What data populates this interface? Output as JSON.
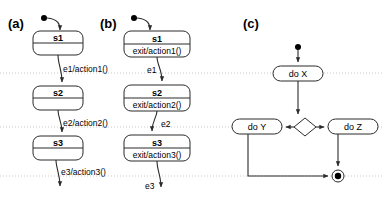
{
  "figure": {
    "type": "uml-state-and-activity-diagrams",
    "width": 383,
    "height": 200,
    "background": "#ffffff",
    "line_color": "#2b2b2b",
    "guide_color": "#c9c9c9"
  },
  "guides": {
    "label": "horizontal dotted alignment guides",
    "y_positions": [
      73,
      127,
      176
    ]
  },
  "panels": [
    {
      "id": "a",
      "label": "(a)",
      "label_x": 8,
      "label_y": 28,
      "kind": "state-machine",
      "description": "states with transition actions on the edges",
      "initial": {
        "name": "initial-state",
        "cx": 44,
        "cy": 18,
        "r": 3
      },
      "states": [
        {
          "name": "s1",
          "activity": "",
          "x": 33,
          "y": 31,
          "w": 50,
          "h": 24,
          "split_y": 43
        },
        {
          "name": "s2",
          "activity": "",
          "x": 33,
          "y": 86,
          "w": 50,
          "h": 24,
          "split_y": 98
        },
        {
          "name": "s3",
          "activity": "",
          "x": 33,
          "y": 136,
          "w": 50,
          "h": 24,
          "split_y": 148
        }
      ],
      "transitions": [
        {
          "label": "e1/action1()",
          "label_x": 62,
          "label_y": 72
        },
        {
          "label": "e2/action2()",
          "label_x": 62,
          "label_y": 126
        },
        {
          "label": "e3/action3()",
          "label_x": 62,
          "label_y": 175
        }
      ]
    },
    {
      "id": "b",
      "label": "(b)",
      "label_x": 100,
      "label_y": 28,
      "kind": "state-machine",
      "description": "states with exit actions inside the state body",
      "initial": {
        "name": "initial-state",
        "cx": 134,
        "cy": 18,
        "r": 3
      },
      "states": [
        {
          "name": "s1",
          "activity": "exit/action1()",
          "x": 124,
          "y": 31,
          "w": 66,
          "h": 26,
          "split_y": 44
        },
        {
          "name": "s2",
          "activity": "exit/action2()",
          "x": 124,
          "y": 85,
          "w": 66,
          "h": 26,
          "split_y": 98
        },
        {
          "name": "s3",
          "activity": "exit/action3()",
          "x": 124,
          "y": 135,
          "w": 66,
          "h": 26,
          "split_y": 148
        }
      ],
      "transitions": [
        {
          "label": "e1",
          "label_x": 148,
          "label_y": 72
        },
        {
          "label": "e2",
          "label_x": 163,
          "label_y": 126
        },
        {
          "label": "e3",
          "label_x": 148,
          "label_y": 186
        }
      ]
    },
    {
      "id": "c",
      "label": "(c)",
      "label_x": 243,
      "label_y": 28,
      "kind": "activity-diagram",
      "description": "initial node, do X, decision, do Y and do Z branches, final node",
      "initial": {
        "name": "initial-node",
        "cx": 298,
        "cy": 47,
        "r": 3
      },
      "final": {
        "name": "final-node",
        "cx": 338,
        "cy": 176,
        "r_outer": 6,
        "r_inner": 3
      },
      "decision": {
        "name": "decision-diamond",
        "cx": 305,
        "cy": 127,
        "rx": 11,
        "ry": 9
      },
      "activities": [
        {
          "name": "do X",
          "x": 273,
          "y": 66,
          "w": 50,
          "h": 15
        },
        {
          "name": "do Y",
          "x": 232,
          "y": 119,
          "w": 50,
          "h": 15
        },
        {
          "name": "do Z",
          "x": 328,
          "y": 119,
          "w": 50,
          "h": 15
        }
      ]
    }
  ]
}
